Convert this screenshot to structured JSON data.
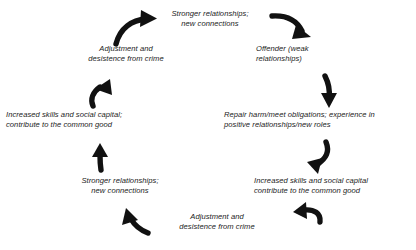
{
  "figure": {
    "type": "cycle-diagram",
    "orientation": "two-branch-circular-flow",
    "background_color": "#ffffff",
    "text_color": "#1b1b1b",
    "arrow_color": "#111111",
    "node_count": 8,
    "arrow_count": 8
  },
  "nodes": {
    "top": {
      "id": "node-top",
      "label": "Stronger relationships;\nnew connections",
      "position": "top-center"
    },
    "right_1": {
      "id": "node-offender",
      "label": "Offender (weak\nrelationships)",
      "position": "upper-right"
    },
    "right_2": {
      "id": "node-repair-harm",
      "label": "Repair harm/meet obligations; experience in\npositive relationships/new roles",
      "position": "middle-right"
    },
    "right_3": {
      "id": "node-increased-skills-right",
      "label": "Increased skills and social capital\ncontribute to the common good",
      "position": "lower-right"
    },
    "bottom": {
      "id": "node-adjustment-bottom",
      "label": "Adjustment and\ndesistence from crime",
      "position": "bottom-center"
    },
    "left_3": {
      "id": "node-stronger-relationships-left",
      "label": "Stronger relationships;\nnew connections",
      "position": "lower-left"
    },
    "left_2": {
      "id": "node-increased-skills-left",
      "label": "Increased skills and social capital;\ncontribute to the common good",
      "position": "middle-left"
    },
    "left_1": {
      "id": "node-adjustment-left",
      "label": "Adjustment and\ndesistence from crime",
      "position": "upper-left"
    }
  },
  "arrows": [
    {
      "id": "arrow-top-left",
      "name": "curved-arrow-up-right",
      "direction": "up-right",
      "from": "node-adjustment-left",
      "to": "node-top"
    },
    {
      "id": "arrow-top-right",
      "name": "curved-arrow-down-right",
      "direction": "down-right",
      "from": "node-top",
      "to": "node-offender"
    },
    {
      "id": "arrow-right-upper",
      "name": "curved-arrow-down",
      "direction": "down",
      "from": "node-offender",
      "to": "node-repair-harm"
    },
    {
      "id": "arrow-right-lower",
      "name": "curved-arrow-down-left",
      "direction": "down-left",
      "from": "node-repair-harm",
      "to": "node-increased-skills-right"
    },
    {
      "id": "arrow-bottom-right",
      "name": "curved-arrow-left",
      "direction": "left",
      "from": "node-increased-skills-right",
      "to": "node-adjustment-bottom"
    },
    {
      "id": "arrow-bottom-left",
      "name": "curved-arrow-up-left",
      "direction": "up-left",
      "from": "node-adjustment-bottom",
      "to": "node-stronger-relationships-left"
    },
    {
      "id": "arrow-left-lower",
      "name": "curved-arrow-up",
      "direction": "up",
      "from": "node-stronger-relationships-left",
      "to": "node-increased-skills-left"
    },
    {
      "id": "arrow-left-upper",
      "name": "curved-arrow-up-right",
      "direction": "up-right",
      "from": "node-increased-skills-left",
      "to": "node-adjustment-left"
    }
  ]
}
